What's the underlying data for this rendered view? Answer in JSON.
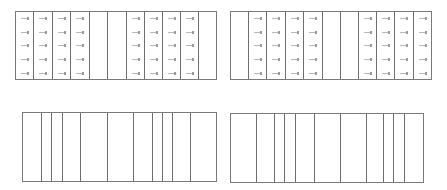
{
  "diagram": {
    "type": "column-grid-panels",
    "line_color": "#6e6e6e",
    "tick_color": "#b8b8b8",
    "panels": [
      {
        "id": "top-left",
        "x": 15,
        "y": 11,
        "width": 202,
        "height": 69,
        "column_edges": [
          33,
          52,
          70,
          89,
          107,
          126,
          144,
          162,
          180,
          198
        ],
        "tick_columns": [
          0,
          1,
          2,
          3,
          6,
          7,
          8,
          9
        ],
        "tick_rows": [
          6,
          20,
          33,
          47,
          61
        ],
        "tick_offset": 5
      },
      {
        "id": "top-right",
        "x": 230,
        "y": 11,
        "width": 202,
        "height": 69,
        "column_edges": [
          248,
          266,
          285,
          303,
          322,
          340,
          358,
          376,
          394,
          413
        ],
        "tick_columns": [
          1,
          2,
          3,
          4,
          7,
          8,
          9,
          10
        ],
        "tick_rows": [
          6,
          20,
          33,
          47,
          61
        ],
        "tick_offset": 5
      },
      {
        "id": "bottom-left",
        "x": 22,
        "y": 112,
        "width": 195,
        "height": 70,
        "column_edges": [
          41,
          51,
          62,
          80,
          107,
          133,
          152,
          162,
          172,
          190
        ],
        "tick_columns": [],
        "tick_rows": [],
        "tick_offset": 0
      },
      {
        "id": "bottom-right",
        "x": 230,
        "y": 113,
        "width": 194,
        "height": 70,
        "column_edges": [
          256,
          274,
          284,
          295,
          314,
          340,
          366,
          383,
          393,
          404
        ],
        "tick_columns": [],
        "tick_rows": [],
        "tick_offset": 0
      }
    ]
  }
}
